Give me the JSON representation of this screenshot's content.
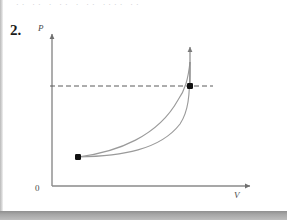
{
  "page": {
    "background": "#ffffff",
    "width": 287,
    "height": 220,
    "cut_off_header_text": "·· ·· · ·· · ·· ···· ··"
  },
  "problem": {
    "number_label": "2."
  },
  "figure": {
    "kind": "pv-diagram",
    "axes": {
      "y_label": "P",
      "x_label": "V",
      "origin_label": "0",
      "axis_color": "#8a8a8a",
      "y_axis": {
        "x": 52,
        "y_top": 32,
        "y_bottom": 186
      },
      "x_axis": {
        "y": 186,
        "x_left": 52,
        "x_right": 252
      }
    },
    "dashed_line": {
      "color": "#5a5a5a",
      "y": 86,
      "x_start": 50,
      "x_end": 213
    },
    "points": [
      {
        "name": "start-state-point",
        "x": 78,
        "y": 157,
        "color": "#101010"
      },
      {
        "name": "end-state-point",
        "x": 190,
        "y": 86,
        "color": "#101010"
      }
    ],
    "curves": [
      {
        "name": "upper-process-curve",
        "color": "#9a9a9a",
        "path": "M 78 157 C 118 152, 158 136, 178 100 C 185 90, 188 80, 190 62"
      },
      {
        "name": "lower-process-curve",
        "color": "#9a9a9a",
        "path": "M 78 157 C 122 156, 160 150, 180 124 C 188 112, 190 98, 190 62"
      }
    ],
    "vertical_arrow": {
      "name": "upward-arrow",
      "color": "#8a8a8a",
      "x": 190,
      "y_bottom": 86,
      "y_top": 45
    }
  },
  "chart_data": {
    "type": "line",
    "title": "",
    "xlabel": "V",
    "ylabel": "P",
    "grid": false,
    "legend": null,
    "annotations": [
      "dashed horizontal constant-pressure line through the end state",
      "upward arrow at the end state",
      "two process curves joining the same start and end states"
    ],
    "series": [
      {
        "name": "upper process path",
        "x": [
          0.13,
          0.33,
          0.52,
          0.66,
          0.74,
          0.78,
          0.8,
          0.81,
          0.81
        ],
        "y": [
          0.19,
          0.22,
          0.28,
          0.38,
          0.5,
          0.62,
          0.76,
          0.88,
          1.0
        ]
      },
      {
        "name": "lower process path",
        "x": [
          0.13,
          0.35,
          0.55,
          0.7,
          0.78,
          0.81,
          0.81,
          0.81,
          0.81
        ],
        "y": [
          0.19,
          0.2,
          0.24,
          0.31,
          0.42,
          0.55,
          0.72,
          0.87,
          1.0
        ]
      }
    ],
    "points": [
      {
        "label": "start state",
        "x": 0.13,
        "y": 0.19
      },
      {
        "label": "end state",
        "x": 0.69,
        "y": 0.65
      }
    ],
    "xlim": [
      0,
      1
    ],
    "ylim": [
      0,
      1
    ]
  }
}
